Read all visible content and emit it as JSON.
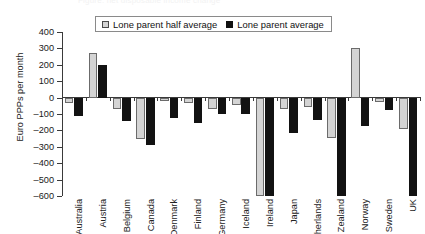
{
  "ghost_title": "Figure: net disposable income change",
  "legend": {
    "position": "top-center-inside",
    "items": [
      {
        "label": "Lone parent half average",
        "swatch": "half",
        "color": "#d4d4d4"
      },
      {
        "label": "Lone parent average",
        "swatch": "full",
        "color": "#111111"
      }
    ]
  },
  "axes": {
    "ylabel": "Euro PPPs per month",
    "xlabel": "",
    "yticks": [
      "400",
      "300",
      "200",
      "100",
      "0",
      "-100",
      "-200",
      "-300",
      "-400",
      "-500",
      "-600"
    ]
  },
  "chart_data": {
    "type": "bar",
    "title": "",
    "xlabel": "",
    "ylabel": "Euro PPPs per month",
    "ylim": [
      -600,
      400
    ],
    "ytick_step": 100,
    "grid": false,
    "legend_position": "top-center-inside",
    "categories": [
      "Australia",
      "Austria",
      "Belgium",
      "Canada",
      "Denmark",
      "Finland",
      "Germany",
      "Iceland",
      "Ireland",
      "Japan",
      "Netherlands",
      "New Zealand",
      "Norway",
      "Sweden",
      "UK"
    ],
    "series": [
      {
        "name": "Lone parent half average",
        "color": "#d4d4d4",
        "values": [
          -30,
          275,
          -70,
          -250,
          -20,
          -35,
          -70,
          -45,
          -600,
          -70,
          -55,
          -245,
          300,
          -25,
          -190
        ]
      },
      {
        "name": "Lone parent average",
        "color": "#111111",
        "values": [
          -115,
          200,
          -140,
          -290,
          -125,
          -155,
          -100,
          -100,
          -600,
          -215,
          -135,
          -600,
          -175,
          -75,
          -600
        ]
      }
    ]
  }
}
